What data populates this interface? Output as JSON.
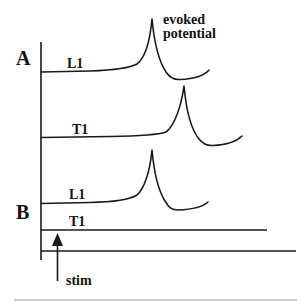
{
  "diagram": {
    "annotation": {
      "line1": "evoked",
      "line2": "potential"
    },
    "panels": [
      {
        "label": "A",
        "traces": [
          {
            "label": "L1",
            "has_evoked_potential": true
          },
          {
            "label": "T1",
            "has_evoked_potential": true
          }
        ]
      },
      {
        "label": "B",
        "traces": [
          {
            "label": "L1",
            "has_evoked_potential": true
          },
          {
            "label": "T1",
            "has_evoked_potential": false
          }
        ]
      }
    ],
    "stimulus": {
      "label": "stim",
      "icon": "up-arrow-icon"
    },
    "colors": {
      "ink": "#1a1a1a",
      "separator": "#9a9a9a",
      "background": "#ffffff"
    }
  }
}
